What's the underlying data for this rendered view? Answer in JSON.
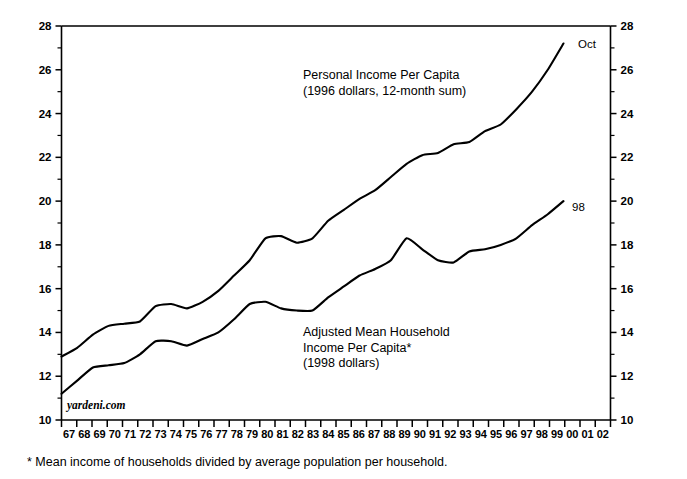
{
  "chart_data": {
    "type": "line",
    "title": "",
    "xlabel": "",
    "ylabel": "",
    "grid": false,
    "legend_position": "inline-annotation",
    "xlim": [
      1967,
      2002
    ],
    "ylim": [
      10,
      28
    ],
    "y_ticks_major": [
      10,
      12,
      14,
      16,
      18,
      20,
      22,
      24,
      26,
      28
    ],
    "y_ticks_minor": [
      11,
      13,
      15,
      17,
      19,
      21,
      23,
      25,
      27
    ],
    "y_tick_labels_left": [
      "10",
      "12",
      "14",
      "16",
      "18",
      "20",
      "22",
      "24",
      "26",
      "28"
    ],
    "y_tick_labels_right": [
      "10",
      "12",
      "14",
      "16",
      "18",
      "20",
      "22",
      "24",
      "26",
      "28"
    ],
    "x_tick_labels": [
      "67",
      "68",
      "69",
      "70",
      "71",
      "72",
      "73",
      "74",
      "75",
      "76",
      "77",
      "78",
      "79",
      "80",
      "81",
      "82",
      "83",
      "84",
      "85",
      "86",
      "87",
      "88",
      "89",
      "90",
      "91",
      "92",
      "93",
      "94",
      "95",
      "96",
      "97",
      "98",
      "99",
      "00",
      "01",
      "02"
    ],
    "x": [
      1967,
      1968,
      1969,
      1970,
      1971,
      1972,
      1973,
      1974,
      1975,
      1976,
      1977,
      1978,
      1979,
      1980,
      1981,
      1982,
      1983,
      1984,
      1985,
      1986,
      1987,
      1988,
      1989,
      1990,
      1991,
      1992,
      1993,
      1994,
      1995,
      1996,
      1997,
      1998,
      1999
    ],
    "series": [
      {
        "name": "Personal Income Per Capita",
        "units": "thousands of 1996 dollars, 12-month sum",
        "end_label": "Oct",
        "values": [
          12.9,
          13.3,
          13.9,
          14.3,
          14.4,
          14.5,
          15.2,
          15.3,
          15.1,
          15.4,
          15.9,
          16.6,
          17.3,
          18.3,
          18.4,
          18.1,
          18.3,
          19.1,
          19.6,
          20.1,
          20.5,
          21.1,
          21.7,
          22.1,
          22.2,
          22.6,
          22.7,
          23.2,
          23.5,
          24.2,
          25.0,
          26.0,
          27.2
        ]
      },
      {
        "name": "Adjusted Mean Household Income Per Capita",
        "units": "thousands of 1998 dollars",
        "end_label": "98",
        "values": [
          11.2,
          11.8,
          12.4,
          12.5,
          12.6,
          13.0,
          13.6,
          13.6,
          13.4,
          13.7,
          14.0,
          14.6,
          15.3,
          15.4,
          15.1,
          15.0,
          15.0,
          15.6,
          16.1,
          16.6,
          16.9,
          17.3,
          18.3,
          17.8,
          17.3,
          17.2,
          17.7,
          17.8,
          18.0,
          18.3,
          18.9,
          19.4,
          20.0
        ]
      }
    ],
    "annotations": [
      {
        "name": "upper-series-annotation",
        "lines": [
          "Personal Income Per Capita",
          "(1996 dollars, 12-month sum)"
        ],
        "x_px": 303,
        "y_px": 79
      },
      {
        "name": "lower-series-annotation",
        "lines": [
          "Adjusted Mean Household",
          "Income Per Capita*",
          "(1998 dollars)"
        ],
        "x_px": 303,
        "y_px": 336
      }
    ],
    "end_labels": [
      {
        "name": "upper-series-end-label",
        "text": "Oct",
        "x_px": 578,
        "y_px": 48
      },
      {
        "name": "lower-series-end-label",
        "text": "98",
        "x_px": 572,
        "y_px": 211
      }
    ],
    "watermark": "yardeni.com",
    "footnote": "* Mean income of households divided by average population per household."
  },
  "colors": {
    "background": "#ffffff",
    "ink": "#000000",
    "line": "#000000"
  }
}
